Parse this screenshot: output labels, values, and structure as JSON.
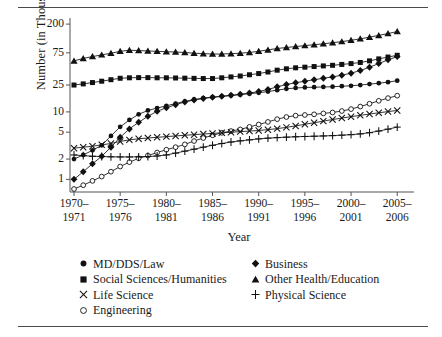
{
  "figure": {
    "top_rule": "horizontal-rule",
    "bottom_rule": "horizontal-rule"
  },
  "axes": {
    "y_title": "Number (in Thousands)",
    "x_title": "Year",
    "y_tick_labels": [
      "200",
      "75",
      "25",
      "10",
      "5",
      "2",
      "1"
    ],
    "x_tick_labels": [
      {
        "line1": "1970–",
        "line2": "1971"
      },
      {
        "line1": "1975–",
        "line2": "1976"
      },
      {
        "line1": "1980–",
        "line2": "1981"
      },
      {
        "line1": "1985–",
        "line2": "1986"
      },
      {
        "line1": "1990–",
        "line2": "1991"
      },
      {
        "line1": "1995–",
        "line2": "1996"
      },
      {
        "line1": "2000–",
        "line2": "2001"
      },
      {
        "line1": "2005–",
        "line2": "2006"
      }
    ]
  },
  "legend": {
    "items": [
      {
        "label": "MD/DDS/Law",
        "marker": "filled-circle",
        "column": 0
      },
      {
        "label": "Business",
        "marker": "filled-diamond",
        "column": 1
      },
      {
        "label": "Social Sciences/Humanities",
        "marker": "filled-square",
        "column": 0
      },
      {
        "label": "Other Health/Education",
        "marker": "filled-triangle",
        "column": 1
      },
      {
        "label": "Life Science",
        "marker": "cross-x",
        "column": 0
      },
      {
        "label": "Physical Science",
        "marker": "plus",
        "column": 1
      },
      {
        "label": "Engineering",
        "marker": "open-circle",
        "column": 0
      }
    ]
  },
  "chart_data": {
    "type": "line",
    "title": "",
    "xlabel": "Year",
    "ylabel": "Number (in Thousands)",
    "y_scale": "log",
    "ylim": [
      0.65,
      230
    ],
    "y_ticks": [
      1,
      2,
      5,
      10,
      25,
      75,
      200
    ],
    "grid": false,
    "legend_position": "below-axes",
    "x": [
      "1970-1971",
      "1971-1972",
      "1972-1973",
      "1973-1974",
      "1974-1975",
      "1975-1976",
      "1976-1977",
      "1977-1978",
      "1978-1979",
      "1979-1980",
      "1980-1981",
      "1981-1982",
      "1982-1983",
      "1983-1984",
      "1984-1985",
      "1985-1986",
      "1986-1987",
      "1987-1988",
      "1988-1989",
      "1989-1990",
      "1990-1991",
      "1991-1992",
      "1992-1993",
      "1993-1994",
      "1994-1995",
      "1995-1996",
      "1996-1997",
      "1997-1998",
      "1998-1999",
      "1999-2000",
      "2000-2001",
      "2001-2002",
      "2002-2003",
      "2003-2004",
      "2004-2005",
      "2005-2006"
    ],
    "x_tick_indices": [
      0,
      5,
      10,
      15,
      20,
      25,
      30,
      35
    ],
    "series": [
      {
        "name": "Other Health/Education",
        "marker": "filled-triangle",
        "values": [
          57,
          62,
          66,
          70,
          74,
          79,
          82,
          81,
          80,
          79,
          78,
          77,
          76,
          74,
          73,
          72,
          72,
          73,
          74,
          76,
          79,
          83,
          87,
          90,
          93,
          96,
          99,
          102,
          106,
          110,
          115,
          121,
          128,
          136,
          145,
          155
        ]
      },
      {
        "name": "Social Sciences/Humanities",
        "marker": "filled-square",
        "values": [
          25.0,
          26.0,
          27.2,
          28.5,
          30.0,
          31.5,
          32.0,
          32.2,
          32.2,
          32.0,
          32.0,
          31.8,
          31.6,
          31.4,
          31.2,
          31.2,
          32.0,
          33.0,
          34.0,
          35.5,
          37.0,
          39.0,
          41.5,
          43.5,
          45.0,
          46.0,
          47.0,
          48.0,
          49.0,
          50.5,
          52.0,
          54.0,
          57.0,
          61.0,
          65.0,
          69.0
        ]
      },
      {
        "name": "Business",
        "marker": "filled-diamond",
        "values": [
          1.0,
          1.3,
          1.7,
          2.2,
          3.0,
          4.2,
          5.6,
          7.0,
          8.6,
          10.2,
          11.5,
          12.8,
          14.0,
          15.0,
          15.8,
          16.5,
          17.0,
          17.6,
          18.2,
          19.0,
          20.0,
          21.5,
          23.5,
          25.5,
          27.0,
          28.5,
          30.0,
          31.5,
          33.0,
          35.0,
          37.5,
          41.0,
          46.0,
          52.0,
          59.0,
          66.0
        ]
      },
      {
        "name": "MD/DDS/Law",
        "marker": "filled-circle",
        "values": [
          2.0,
          2.3,
          2.7,
          3.2,
          4.4,
          6.0,
          7.6,
          9.2,
          10.5,
          11.4,
          12.3,
          13.3,
          14.3,
          15.3,
          16.0,
          16.5,
          17.0,
          17.5,
          18.0,
          18.6,
          19.2,
          20.0,
          21.0,
          22.0,
          22.6,
          23.0,
          23.2,
          23.4,
          23.6,
          24.0,
          24.4,
          25.0,
          25.8,
          26.6,
          27.6,
          29.0
        ]
      },
      {
        "name": "Engineering",
        "marker": "open-circle",
        "values": [
          0.72,
          0.82,
          0.95,
          1.1,
          1.3,
          1.55,
          1.8,
          2.05,
          2.25,
          2.5,
          2.75,
          3.0,
          3.3,
          3.7,
          4.1,
          4.5,
          4.9,
          5.2,
          5.5,
          6.0,
          6.5,
          7.1,
          7.8,
          8.4,
          8.8,
          9.0,
          9.2,
          9.5,
          9.8,
          10.3,
          11.0,
          12.0,
          13.2,
          14.6,
          16.0,
          17.4
        ]
      },
      {
        "name": "Life Science",
        "marker": "cross-x",
        "values": [
          2.9,
          3.0,
          3.1,
          3.25,
          3.4,
          3.65,
          3.85,
          4.0,
          4.1,
          4.2,
          4.3,
          4.4,
          4.5,
          4.6,
          4.7,
          4.8,
          4.9,
          5.0,
          5.1,
          5.2,
          5.3,
          5.45,
          5.65,
          5.9,
          6.2,
          6.55,
          6.9,
          7.3,
          7.7,
          8.1,
          8.5,
          8.9,
          9.3,
          9.7,
          10.1,
          10.5
        ]
      },
      {
        "name": "Physical Science",
        "marker": "plus",
        "values": [
          2.3,
          2.25,
          2.2,
          2.18,
          2.16,
          2.15,
          2.15,
          2.16,
          2.18,
          2.22,
          2.3,
          2.45,
          2.62,
          2.8,
          3.0,
          3.2,
          3.4,
          3.58,
          3.72,
          3.85,
          3.98,
          4.08,
          4.16,
          4.22,
          4.28,
          4.32,
          4.36,
          4.4,
          4.45,
          4.52,
          4.6,
          4.72,
          4.92,
          5.2,
          5.55,
          5.95
        ]
      }
    ]
  }
}
